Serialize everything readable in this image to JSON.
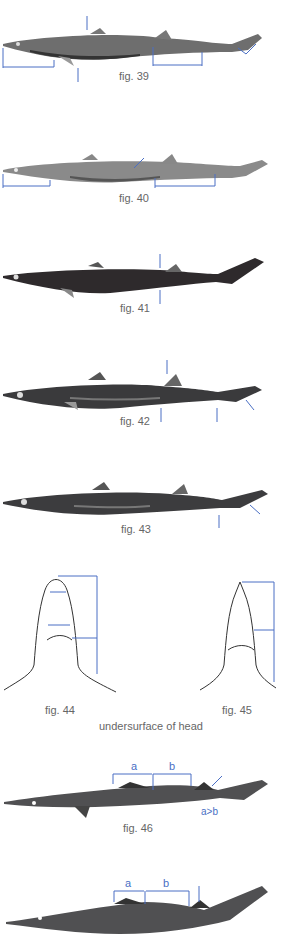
{
  "figures": [
    {
      "id": "fig39",
      "caption": "fig. 39",
      "shade": "#6e6e6e",
      "belly": "#3a3a3a"
    },
    {
      "id": "fig40",
      "caption": "fig. 40",
      "shade": "#8a8a8a",
      "belly": "#555555"
    },
    {
      "id": "fig41",
      "caption": "fig. 41",
      "shade": "#2e2a2c",
      "belly": "#2e2a2c"
    },
    {
      "id": "fig42",
      "caption": "fig. 42",
      "shade": "#3a3a3c",
      "belly": "#2a2a2c"
    },
    {
      "id": "fig43",
      "caption": "fig. 43",
      "shade": "#3c3c3e",
      "belly": "#2c2c2e"
    },
    {
      "id": "fig44",
      "caption": "fig. 44"
    },
    {
      "id": "fig45",
      "caption": "fig. 45"
    },
    {
      "id": "fig46",
      "caption": "fig. 46",
      "label_a": "a",
      "label_b": "b",
      "note": "a>b"
    },
    {
      "id": "fig47",
      "label_a": "a",
      "label_b": "b"
    }
  ],
  "head_caption": "undersurface of head",
  "colors": {
    "arrow": "#4a6fc4",
    "line": "#333333"
  }
}
